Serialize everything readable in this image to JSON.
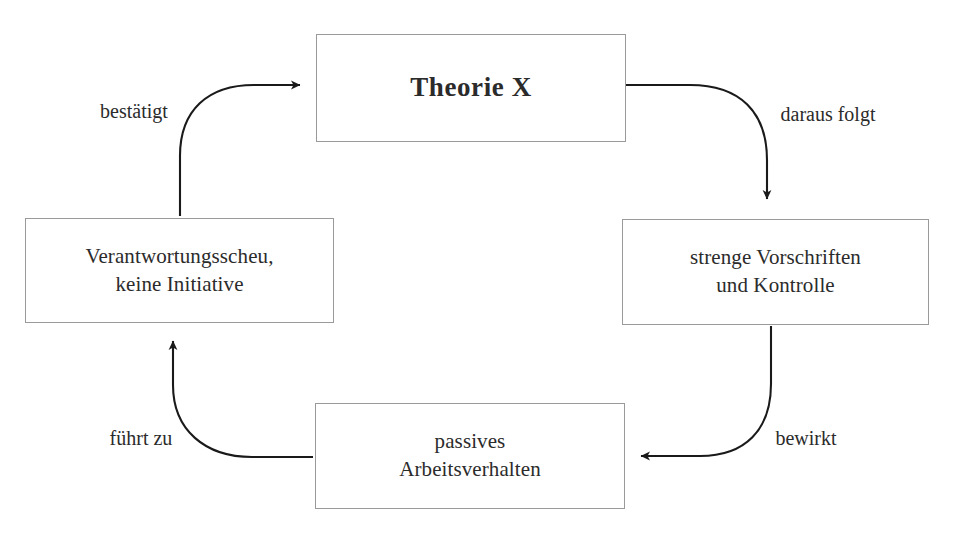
{
  "diagram": {
    "type": "cycle-diagram",
    "title_node": "Theorie X",
    "background_color": "#ffffff",
    "line_color": "#1a1a1a",
    "box_border_color": "#9a9a9a",
    "text_color": "#2b2b2b",
    "nodes": [
      {
        "id": "theorie-x",
        "label": "Theorie X",
        "position": "top"
      },
      {
        "id": "vorschriften",
        "label": "strenge Vorschriften\nund Kontrolle",
        "position": "right"
      },
      {
        "id": "arbeitsverhalten",
        "label": "passives\nArbeitsverhalten",
        "position": "bottom"
      },
      {
        "id": "verantwortungsscheu",
        "label": "Verantwortungsscheu,\nkeine Initiative",
        "position": "left"
      }
    ],
    "edges": [
      {
        "id": "daraus-folgt",
        "label": "daraus folgt",
        "from": "theorie-x",
        "to": "vorschriften"
      },
      {
        "id": "bewirkt",
        "label": "bewirkt",
        "from": "vorschriften",
        "to": "arbeitsverhalten"
      },
      {
        "id": "fuehrt-zu",
        "label": "führt zu",
        "from": "arbeitsverhalten",
        "to": "verantwortungsscheu"
      },
      {
        "id": "bestaetigt",
        "label": "bestätigt",
        "from": "verantwortungsscheu",
        "to": "theorie-x"
      }
    ]
  }
}
